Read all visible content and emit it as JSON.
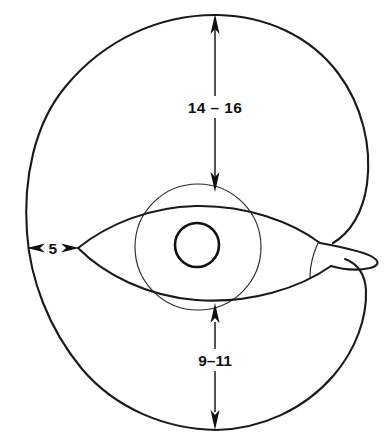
{
  "figure": {
    "background_color": "#ffffff",
    "line_color": "#1a1a1a",
    "thin_line_color": "#2b2b2b"
  },
  "dimensions": {
    "top": {
      "label": "14 – 16",
      "name": "dorsal-whorl-height",
      "orientation": "vertical",
      "arrow_start": "outer-shell-top",
      "arrow_end": "inner-whorl-top"
    },
    "bottom": {
      "label": "9–11",
      "name": "ventral-whorl-height",
      "orientation": "vertical",
      "arrow_start": "inner-whorl-bottom",
      "arrow_end": "outer-shell-bottom"
    },
    "left": {
      "label": "5",
      "name": "lateral-gap",
      "orientation": "horizontal",
      "arrow_start": "outer-shell-left",
      "arrow_end": "aperture-left-vertex"
    }
  },
  "shapes": {
    "outer_shell": "outer-spiral-whorl",
    "inner_whorl": "inner-whorl-circle",
    "aperture": "lens-shaped-aperture",
    "protoconch": "central-protoconch-circle",
    "venter_tip": "aperture-rostrum-tip"
  }
}
